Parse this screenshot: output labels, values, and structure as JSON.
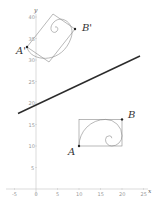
{
  "figure": {
    "axes": {
      "x_label": "x",
      "y_label": "y",
      "x_ticks": [
        "-5",
        "0",
        "5",
        "10",
        "15",
        "20",
        "25"
      ],
      "y_ticks": [
        "5",
        "10",
        "15",
        "20",
        "25",
        "30",
        "35",
        "40"
      ],
      "axis_color": "#bdbdbd"
    },
    "mirror_line": {
      "color": "#2b2b2b",
      "approx_equation": "y = 0.47x + 19.6"
    },
    "original": {
      "point_a_label": "A",
      "point_b_label": "B",
      "point_a": [
        10,
        10
      ],
      "point_b": [
        20,
        16.18
      ]
    },
    "image": {
      "point_a_label": "A'",
      "point_b_label": "B'"
    },
    "shape_color": "#8a8a8a",
    "point_color": "#222222"
  }
}
